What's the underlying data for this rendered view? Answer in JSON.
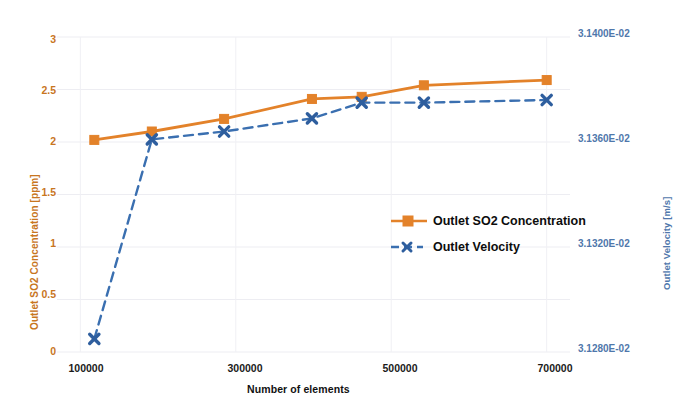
{
  "chart_data": {
    "type": "line",
    "title": "",
    "xlabel": "Number of elements",
    "series": [
      {
        "name": "Outlet SO2 Concentration",
        "axis": "left",
        "color": "#E3822A",
        "marker": "square",
        "linestyle": "solid",
        "x": [
          118000,
          192000,
          285000,
          398000,
          462000,
          542000,
          700000
        ],
        "values": [
          2.02,
          2.1,
          2.22,
          2.41,
          2.43,
          2.54,
          2.59
        ]
      },
      {
        "name": "Outlet Velocity",
        "axis": "right",
        "color": "#3A6FB0",
        "marker": "x",
        "linestyle": "dashed",
        "x": [
          118000,
          192000,
          285000,
          398000,
          462000,
          542000,
          700000
        ],
        "values": [
          0.031285,
          0.031361,
          0.031364,
          0.031369,
          0.031375,
          0.031375,
          0.031376
        ]
      }
    ],
    "xlim": [
      70000,
      730000
    ],
    "xticks": [
      100000,
      300000,
      500000,
      700000
    ],
    "xtick_labels": [
      "100000",
      "300000",
      "500000",
      "700000"
    ],
    "left_axis": {
      "label": "Outlet SO2 Concentration [ppm]",
      "ylim": [
        0,
        3
      ],
      "ticks": [
        0,
        0.5,
        1,
        1.5,
        2,
        2.5,
        3
      ],
      "tick_labels": [
        "0",
        "0.5",
        "1",
        "1.5",
        "2",
        "2.5",
        "3"
      ],
      "color": "#C8761F"
    },
    "right_axis": {
      "label": "Outlet Velocity [m/s]",
      "ylim": [
        0.03128,
        0.0314
      ],
      "ticks": [
        0.03128,
        0.03132,
        0.03136,
        0.0314
      ],
      "tick_labels": [
        "3.1280E-02",
        "3.1320E-02",
        "3.1360E-02",
        "3.1400E-02"
      ],
      "color": "#4F77AB"
    },
    "legend": {
      "position": "center-right-inside",
      "entries": [
        "Outlet SO2 Concentration",
        "Outlet Velocity"
      ]
    },
    "grid": true
  }
}
